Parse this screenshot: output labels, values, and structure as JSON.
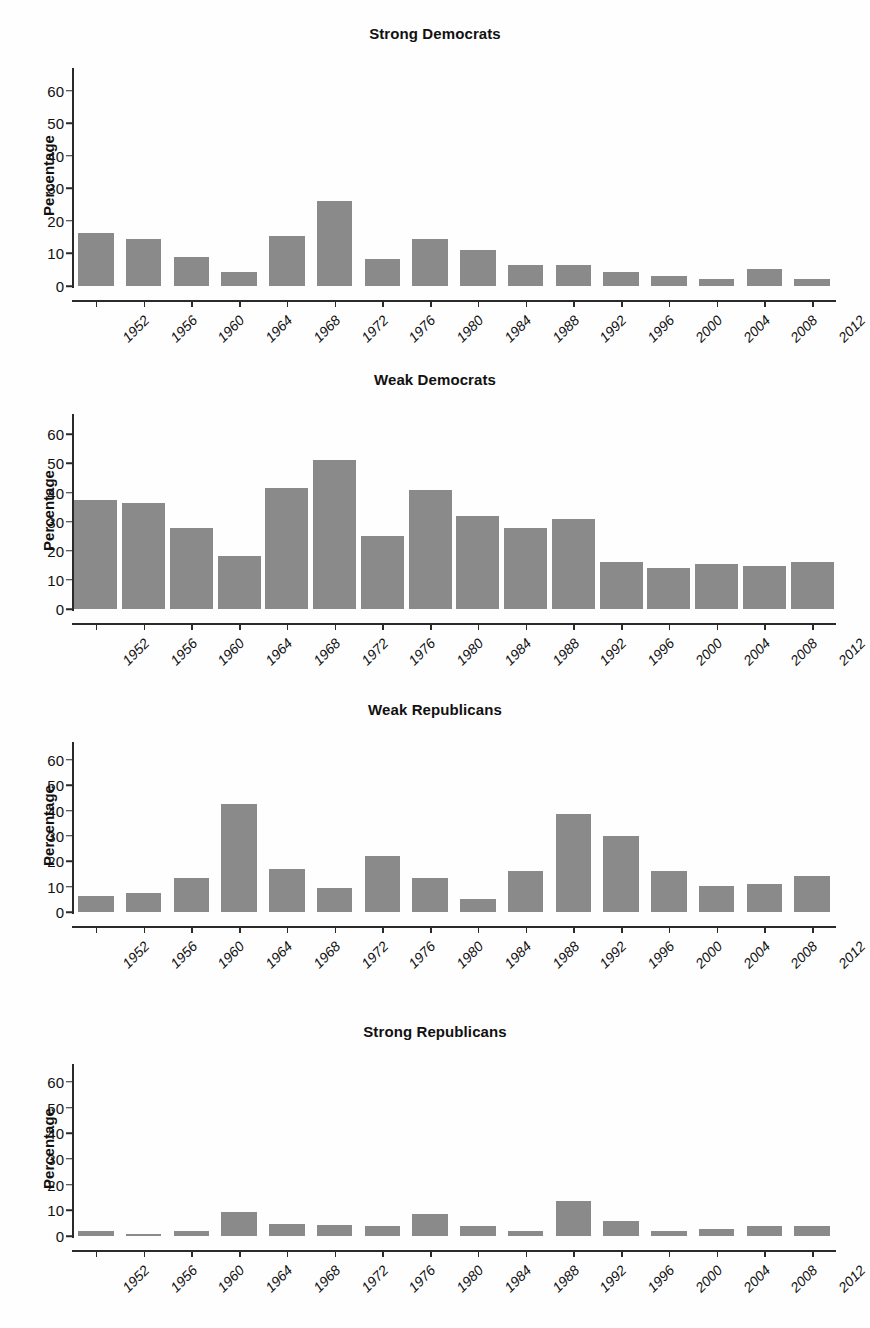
{
  "figure": {
    "axis_title": "Percentage",
    "y_ticks": [
      0,
      10,
      20,
      30,
      40,
      50,
      60
    ],
    "y_max": 67,
    "categories": [
      "1952",
      "1956",
      "1960",
      "1964",
      "1968",
      "1972",
      "1976",
      "1980",
      "1984",
      "1988",
      "1992",
      "1996",
      "2000",
      "2004",
      "2008",
      "2012"
    ],
    "bar_color": "#8a8a8a",
    "axis_color": "#2a2a2a"
  },
  "chart_data": [
    {
      "type": "bar",
      "title": "Strong Democrats",
      "xlabel": "",
      "ylabel": "Percentage",
      "ylim": [
        0,
        67
      ],
      "grid": false,
      "legend": "none",
      "categories": [
        "1952",
        "1956",
        "1960",
        "1964",
        "1968",
        "1972",
        "1976",
        "1980",
        "1984",
        "1988",
        "1992",
        "1996",
        "2000",
        "2004",
        "2008",
        "2012"
      ],
      "values": [
        16.3,
        14.4,
        9.0,
        4.4,
        15.3,
        26.0,
        8.4,
        14.4,
        11.2,
        6.5,
        6.4,
        4.4,
        3.2,
        2.1,
        5.1,
        2.1
      ]
    },
    {
      "type": "bar",
      "title": "Weak Democrats",
      "xlabel": "",
      "ylabel": "Percentage",
      "ylim": [
        0,
        67
      ],
      "grid": false,
      "legend": "none",
      "categories": [
        "1952",
        "1956",
        "1960",
        "1964",
        "1968",
        "1972",
        "1976",
        "1980",
        "1984",
        "1988",
        "1992",
        "1996",
        "2000",
        "2004",
        "2008",
        "2012"
      ],
      "values": [
        37.5,
        36.5,
        28.0,
        18.3,
        41.5,
        51.3,
        25.0,
        40.8,
        31.8,
        28.0,
        31.0,
        16.3,
        14.2,
        15.3,
        14.9,
        16.1
      ]
    },
    {
      "type": "bar",
      "title": "Weak Republicans",
      "xlabel": "",
      "ylabel": "Percentage",
      "ylim": [
        0,
        67
      ],
      "grid": false,
      "legend": "none",
      "categories": [
        "1952",
        "1956",
        "1960",
        "1964",
        "1968",
        "1972",
        "1976",
        "1980",
        "1984",
        "1988",
        "1992",
        "1996",
        "2000",
        "2004",
        "2008",
        "2012"
      ],
      "values": [
        6.3,
        7.3,
        13.3,
        42.5,
        16.8,
        9.5,
        22.0,
        13.5,
        5.3,
        16.0,
        38.5,
        30.0,
        16.0,
        10.3,
        11.2,
        14.3
      ]
    },
    {
      "type": "bar",
      "title": "Strong Republicans",
      "xlabel": "",
      "ylabel": "Percentage",
      "ylim": [
        0,
        67
      ],
      "grid": false,
      "legend": "none",
      "categories": [
        "1952",
        "1956",
        "1960",
        "1964",
        "1968",
        "1972",
        "1976",
        "1980",
        "1984",
        "1988",
        "1992",
        "1996",
        "2000",
        "2004",
        "2008",
        "2012"
      ],
      "values": [
        1.8,
        0.8,
        1.8,
        9.5,
        4.7,
        4.1,
        4.0,
        8.5,
        4.0,
        1.8,
        13.5,
        5.8,
        1.8,
        2.8,
        3.8,
        3.8
      ]
    }
  ]
}
